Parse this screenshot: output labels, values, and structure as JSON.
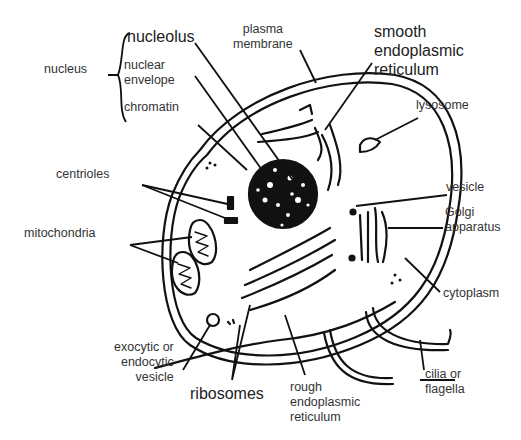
{
  "diagram": {
    "colors": {
      "ink": "#111111",
      "label_text": "#333333",
      "background": "#ffffff"
    },
    "labels": {
      "nucleus": "nucleus",
      "nucleolus": "nucleolus",
      "nuclear_envelope": [
        "nuclear",
        "envelope"
      ],
      "chromatin": "chromatin",
      "plasma_membrane": [
        "plasma",
        "membrane"
      ],
      "smooth_er": [
        "smooth",
        "endoplasmic",
        "reticulum"
      ],
      "lysosome": "lysosome",
      "centrioles": "centrioles",
      "mitochondria": "mitochondria",
      "vesicle": "vesicle",
      "golgi": [
        "Golgi",
        "apparatus"
      ],
      "cytoplasm": "cytoplasm",
      "exocytic_vesicle": [
        "exocytic or",
        "endocytic",
        "vesicle"
      ],
      "ribosomes": "ribosomes",
      "rough_er": [
        "rough",
        "endoplasmic",
        "reticulum"
      ],
      "cilia": [
        "cilia or",
        "flagella"
      ]
    }
  }
}
